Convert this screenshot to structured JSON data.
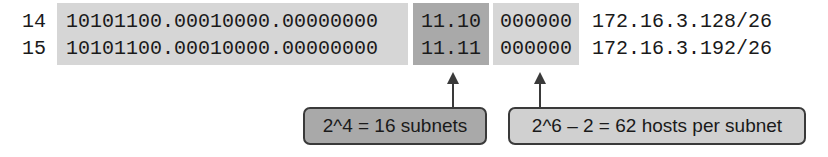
{
  "rows": [
    {
      "number": "14",
      "network_bits": "10101100.00010000.00000000",
      "subnet_bits": "11.10",
      "host_bits": "000000",
      "subnet_address": "172.16.3.128/26"
    },
    {
      "number": "15",
      "network_bits": "10101100.00010000.00000000",
      "subnet_bits": "11.11",
      "host_bits": "000000",
      "subnet_address": "172.16.3.192/26"
    }
  ],
  "callouts": {
    "subnets": "2^4 = 16 subnets",
    "hosts": "2^6 – 2 = 62 hosts per subnet"
  },
  "colors": {
    "network_bg": "#d6d6d6",
    "subnet_bg": "#a9a9a9",
    "host_bg": "#d6d6d6",
    "border": "#3a3a3a"
  }
}
